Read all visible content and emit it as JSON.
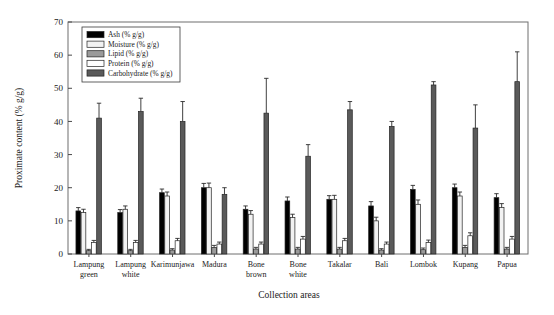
{
  "chart_data": {
    "type": "bar",
    "title": "",
    "subtitle": "",
    "xlabel": "Collection areas",
    "ylabel": "Proximate content (% g/g)",
    "ylim": [
      0,
      70
    ],
    "yticks": [
      0,
      10,
      20,
      30,
      40,
      50,
      60,
      70
    ],
    "ytick_labels": [
      "0",
      "10",
      "20",
      "30",
      "40",
      "50",
      "60",
      "70"
    ],
    "grid": false,
    "legend_position": "upper left",
    "error_bars": true,
    "categories": [
      "Lampung green",
      "Lampung white",
      "Karimunjawa",
      "Madura",
      "Bone brown",
      "Bone white",
      "Takalar",
      "Bali",
      "Lombok",
      "Kupang",
      "Papua"
    ],
    "category_lines": [
      [
        "Lampung",
        "green"
      ],
      [
        "Lampung",
        "white"
      ],
      [
        "Karimunjawa",
        ""
      ],
      [
        "Madura",
        ""
      ],
      [
        "Bone",
        "brown"
      ],
      [
        "Bone",
        "white"
      ],
      [
        "Takalar",
        ""
      ],
      [
        "Bali",
        ""
      ],
      [
        "Lombok",
        ""
      ],
      [
        "Kupang",
        ""
      ],
      [
        "Papua",
        ""
      ]
    ],
    "series": [
      {
        "name": "Ash (% g/g)",
        "color": "#000000",
        "values": [
          13.0,
          12.5,
          18.5,
          20.0,
          13.5,
          16.0,
          16.5,
          14.5,
          19.5,
          20.0,
          17.0
        ],
        "errors": [
          1.0,
          0.9,
          1.1,
          1.3,
          1.0,
          1.2,
          1.1,
          1.3,
          1.2,
          1.1,
          1.2
        ]
      },
      {
        "name": "Moisture (% g/g)",
        "color": "#f2f2f2",
        "values": [
          12.5,
          13.5,
          17.5,
          20.0,
          12.0,
          11.0,
          16.5,
          10.0,
          15.0,
          17.5,
          14.0
        ],
        "errors": [
          1.0,
          1.0,
          1.2,
          1.4,
          1.1,
          1.0,
          1.2,
          1.1,
          1.3,
          1.2,
          1.2
        ]
      },
      {
        "name": "Lipid (% g/g)",
        "color": "#9a9a9a",
        "values": [
          1.0,
          1.0,
          1.2,
          2.0,
          1.5,
          1.5,
          1.5,
          1.2,
          1.3,
          2.0,
          1.5
        ],
        "errors": [
          0.4,
          0.4,
          0.4,
          0.6,
          0.5,
          0.5,
          0.5,
          0.4,
          0.5,
          0.6,
          0.5
        ]
      },
      {
        "name": "Protein (% g/g)",
        "color": "#ffffff",
        "values": [
          3.5,
          3.5,
          4.0,
          3.0,
          3.0,
          4.5,
          4.0,
          3.0,
          3.5,
          5.5,
          4.5
        ],
        "errors": [
          0.6,
          0.6,
          0.7,
          0.6,
          0.6,
          0.8,
          0.7,
          0.6,
          0.7,
          0.9,
          0.8
        ]
      },
      {
        "name": "Carbohydrate (% g/g)",
        "color": "#5a5a5a",
        "values": [
          41.0,
          43.0,
          40.0,
          18.0,
          42.5,
          29.5,
          43.5,
          38.5,
          51.0,
          38.0,
          52.0
        ],
        "errors": [
          4.5,
          4.0,
          6.0,
          2.0,
          10.5,
          3.5,
          2.5,
          1.5,
          1.0,
          7.0,
          9.0
        ]
      }
    ]
  },
  "legend": {
    "entries": [
      "Ash (% g/g)",
      "Moisture (% g/g)",
      "Lipid (% g/g)",
      "Protein (% g/g)",
      "Carbohydrate (% g/g)"
    ]
  },
  "axes": {
    "y_title": "Proximate content (% g/g)",
    "x_title": "Collection areas"
  }
}
